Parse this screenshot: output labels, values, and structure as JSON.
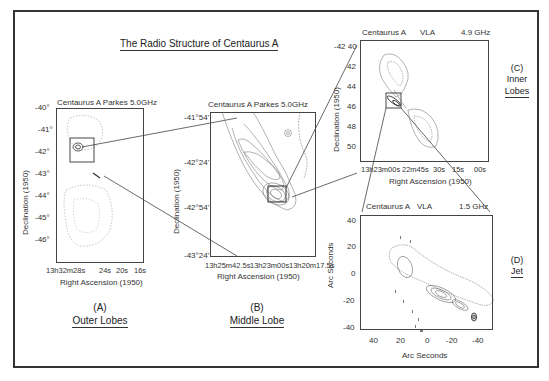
{
  "title": "The Radio Structure of Centaurus A",
  "panels": {
    "A": {
      "header": "Centaurus A  Parkes 5.0GHz",
      "ylabel": "Declination (1950)",
      "xlabel": "Right Ascension (1950)",
      "yticks": [
        "-40°",
        "-41°",
        "-42°",
        "-43°",
        "-44°",
        "-45°",
        "-46°"
      ],
      "xticks": [
        "13h32m28s",
        "24s",
        "20s",
        "16s"
      ],
      "letter": "(A)",
      "name": "Outer Lobes"
    },
    "B": {
      "header": "Centaurus A  Parkes 5.0GHz",
      "ylabel": "Declination (1950)",
      "xlabel": "Right Ascension (1950)",
      "yticks": [
        "-41°54'",
        "-42°24'",
        "-42°54'",
        "-43°24'"
      ],
      "xticks": [
        "13h25m42.5s",
        "13h23m00s",
        "13h20m17.5s"
      ],
      "letter": "(B)",
      "name": "Middle Lobe"
    },
    "C": {
      "header_left": "Centaurus A",
      "header_mid": "VLA",
      "header_right": "4.9 GHz",
      "ylabel": "Declination (1950)",
      "xlabel": "Right Ascension (1950)",
      "yticks": [
        "-42 40",
        "42",
        "44",
        "46",
        "48",
        "50"
      ],
      "xticks": [
        "13h23m00s",
        "22m45s",
        "30s",
        "15s",
        "00s"
      ],
      "letter": "(C)",
      "name_line1": "Inner",
      "name_line2": "Lobes"
    },
    "D": {
      "header_left": "Centaurus A",
      "header_mid": "VLA",
      "header_right": "1.5 GHz",
      "ylabel": "Arc Seconds",
      "xlabel": "Arc Seconds",
      "yticks": [
        "40",
        "20",
        "0",
        "-20",
        "-40"
      ],
      "xticks": [
        "40",
        "20",
        "0",
        "-20",
        "-40"
      ],
      "letter": "(D)",
      "name": "Jet"
    }
  }
}
